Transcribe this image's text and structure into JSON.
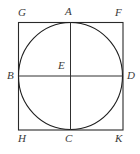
{
  "figure": {
    "background_color": "#ffffff",
    "stroke_color": "#1c1c1c",
    "label_color": "#3a3a3a",
    "square": {
      "left": 18,
      "top": 22,
      "right": 123,
      "bottom": 130,
      "width": 105,
      "height": 108
    },
    "circle": {
      "center_x": 70.5,
      "center_y": 76,
      "radius_x": 52.5,
      "radius_y": 54
    },
    "labels": {
      "top_left_corner": "G",
      "top_tangent": "A",
      "top_right_corner": "F",
      "left_tangent": "B",
      "center": "E",
      "right_tangent": "D",
      "bottom_left_corner": "H",
      "bottom_tangent": "C",
      "bottom_right_corner": "K"
    }
  }
}
